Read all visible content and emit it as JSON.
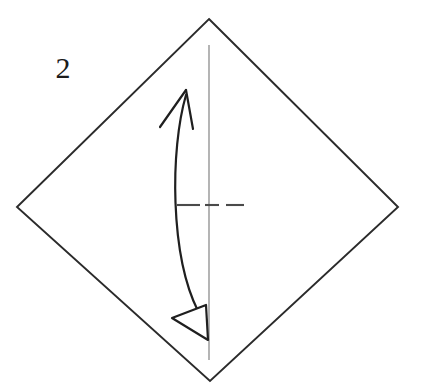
{
  "diagram": {
    "step_number": "2",
    "background_color": "#ffffff",
    "ink_color": "#1f1f1f",
    "paper_edge_color": "#2b2b2b",
    "crease_line_color": "#8d8d8d",
    "dash_line_color": "#4a4a4a"
  },
  "paper": {
    "shape_name": "square rotated 45 degrees",
    "vertices": {
      "top": [
        209,
        19
      ],
      "right": [
        398,
        207
      ],
      "bottom": [
        210,
        381
      ],
      "left": [
        17,
        207
      ]
    },
    "points_attr": "209,19 398,207 210,381 17,207"
  },
  "center_crease": {
    "label": "vertical center line",
    "x": 209,
    "y_start": 45,
    "y_end": 360
  },
  "valley_fold": {
    "label": "horizontal dashed fold line",
    "y": 205,
    "dashes": [
      {
        "x1": 177,
        "x2": 200
      },
      {
        "x1": 205,
        "x2": 219
      },
      {
        "x1": 226,
        "x2": 244
      }
    ]
  },
  "fold_arrow": {
    "label": "fold and unfold arrow",
    "shaft_path": "M 186,95 C 170,150 170,255 198,311",
    "top_head": {
      "label": "open-v-arrowhead-up",
      "tip": [
        186,
        90
      ],
      "barb_left_path": "M 160,127 L 186,90",
      "barb_right_path": "M 186,90 L 193,129"
    },
    "bottom_head": {
      "label": "hollow-triangle-arrowhead-down",
      "points_attr": "172,318 206,305 208,340"
    }
  }
}
